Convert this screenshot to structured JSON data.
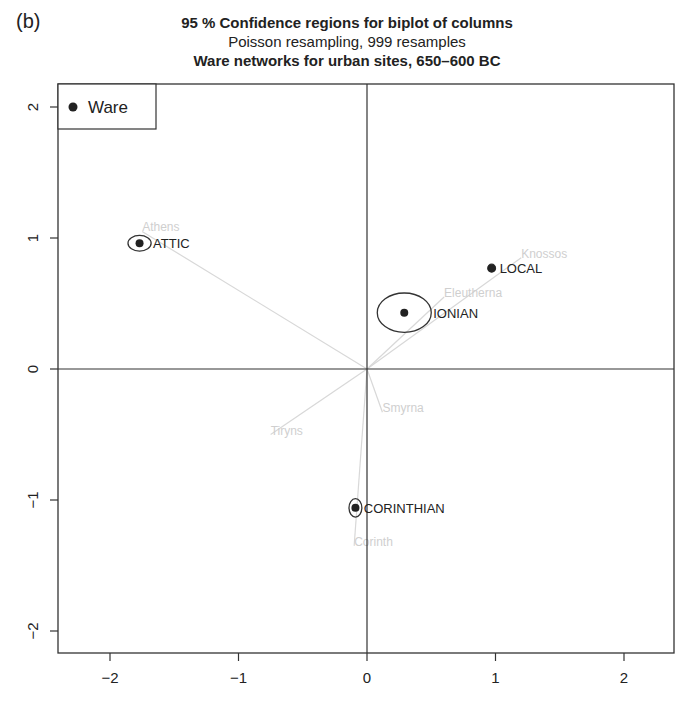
{
  "panel_label": "(b)",
  "chart_data": {
    "type": "scatter",
    "title": "95 % Confidence regions for biplot of columns",
    "subtitle": "Poisson resampling, 999 resamples",
    "subtitle2": "Ware networks for urban sites, 650–600 BC",
    "xlabel": "",
    "ylabel": "",
    "xlim": [
      -2.45,
      2.4
    ],
    "ylim": [
      -2.2,
      2.15
    ],
    "xticks": [
      -2,
      -1,
      0,
      1,
      2
    ],
    "yticks": [
      -2,
      -1,
      0,
      1,
      2
    ],
    "grid": false,
    "reference_lines": {
      "x": 0,
      "y": 0
    },
    "legend": {
      "position": "top-left",
      "entries": [
        "Ware"
      ]
    },
    "series": [
      {
        "name": "Ware",
        "points": [
          {
            "label": "ATTIC",
            "x": -1.77,
            "y": 0.96,
            "ellipse_rx": 0.09,
            "ellipse_ry": 0.06
          },
          {
            "label": "LOCAL",
            "x": 0.97,
            "y": 0.77,
            "ellipse_rx": 0.03,
            "ellipse_ry": 0.03
          },
          {
            "label": "IONIAN",
            "x": 0.29,
            "y": 0.43,
            "ellipse_rx": 0.21,
            "ellipse_ry": 0.15
          },
          {
            "label": "CORINTHIAN",
            "x": -0.09,
            "y": -1.06,
            "ellipse_rx": 0.05,
            "ellipse_ry": 0.07
          }
        ]
      },
      {
        "name": "Sites (faint biplot arrows)",
        "points": [
          {
            "label": "Athens",
            "x": -1.75,
            "y": 1.05
          },
          {
            "label": "Knossos",
            "x": 1.2,
            "y": 0.85
          },
          {
            "label": "Eleutherna",
            "x": 0.6,
            "y": 0.55
          },
          {
            "label": "Tiryns",
            "x": -0.75,
            "y": -0.5
          },
          {
            "label": "Smyrna",
            "x": 0.12,
            "y": -0.33
          },
          {
            "label": "Corinth",
            "x": -0.1,
            "y": -1.35
          }
        ]
      }
    ]
  }
}
